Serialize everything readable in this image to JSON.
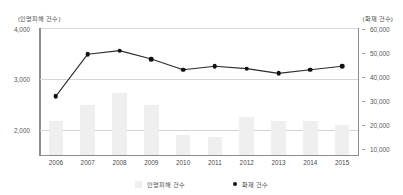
{
  "chart_data": {
    "type": "bar",
    "title": "",
    "subtitle": "",
    "xlabel": "",
    "ylabel": "(인명피해 건수)",
    "y2label": "(화재 건수)",
    "grid": true,
    "legend_position": "bottom",
    "categories": [
      "2006",
      "2007",
      "2008",
      "2009",
      "2010",
      "2011",
      "2012",
      "2013",
      "2014",
      "2015"
    ],
    "left_axis": {
      "label": "(인명피해 건수)",
      "ticks": [
        "2,000",
        "3,000",
        "4,000"
      ],
      "tick_values": [
        2000,
        3000,
        4000
      ],
      "ylim": [
        1500,
        4000
      ]
    },
    "right_axis": {
      "label": "(화재 건수)",
      "ticks": [
        "10,000",
        "20,000",
        "30,000",
        "40,000",
        "50,000",
        "60,000"
      ],
      "tick_values": [
        10000,
        20000,
        30000,
        40000,
        50000,
        60000
      ],
      "ylim": [
        7500,
        60000
      ]
    },
    "series": [
      {
        "name": "인명피해 건수",
        "type": "bar",
        "axis": "left",
        "color": "#efefef",
        "values": [
          2180,
          2490,
          2730,
          2490,
          1890,
          1860,
          2260,
          2180,
          2180,
          2090
        ]
      },
      {
        "name": "화재 건수",
        "type": "line",
        "axis": "right",
        "color": "#111111",
        "values": [
          32000,
          49500,
          51000,
          47500,
          43000,
          44500,
          43500,
          41500,
          43000,
          44500
        ]
      }
    ]
  },
  "legend": {
    "items": [
      {
        "label": "인명피해 건수",
        "marker": "bar-swatch-icon"
      },
      {
        "label": "화재 건수",
        "marker": "dot-marker-icon"
      }
    ]
  }
}
